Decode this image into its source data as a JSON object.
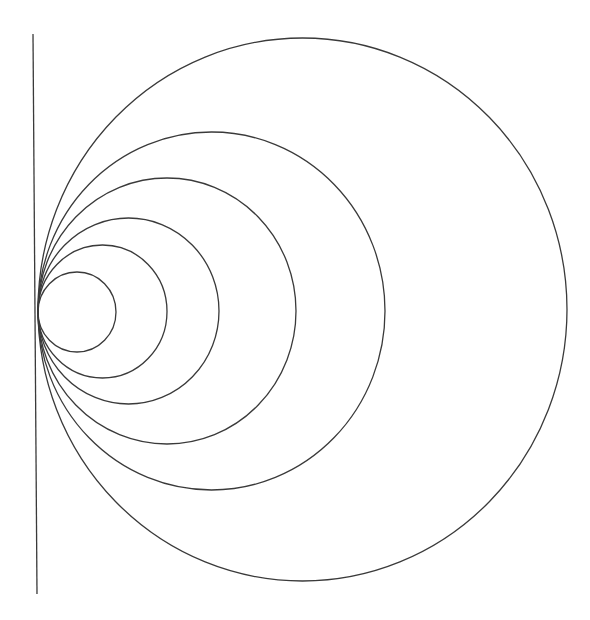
{
  "diagram": {
    "type": "nested tangent circles",
    "stroke_color": "#3a3a3a",
    "background_color": "#ffffff",
    "tangent_line": {
      "x1": 33,
      "y1": 34,
      "x2": 37,
      "y2": 594
    },
    "tangent_point": {
      "x": 38,
      "y": 311
    },
    "circles": [
      {
        "cx": 77,
        "cy": 312,
        "rx": 39,
        "ry": 40
      },
      {
        "cx": 102.5,
        "cy": 311.5,
        "rx": 64.5,
        "ry": 66.5
      },
      {
        "cx": 128.5,
        "cy": 311,
        "rx": 90.5,
        "ry": 93
      },
      {
        "cx": 167,
        "cy": 311,
        "rx": 129,
        "ry": 133
      },
      {
        "cx": 211.5,
        "cy": 311,
        "rx": 173.5,
        "ry": 179
      },
      {
        "cx": 302.5,
        "cy": 309.5,
        "rx": 264.5,
        "ry": 271.5
      }
    ]
  }
}
